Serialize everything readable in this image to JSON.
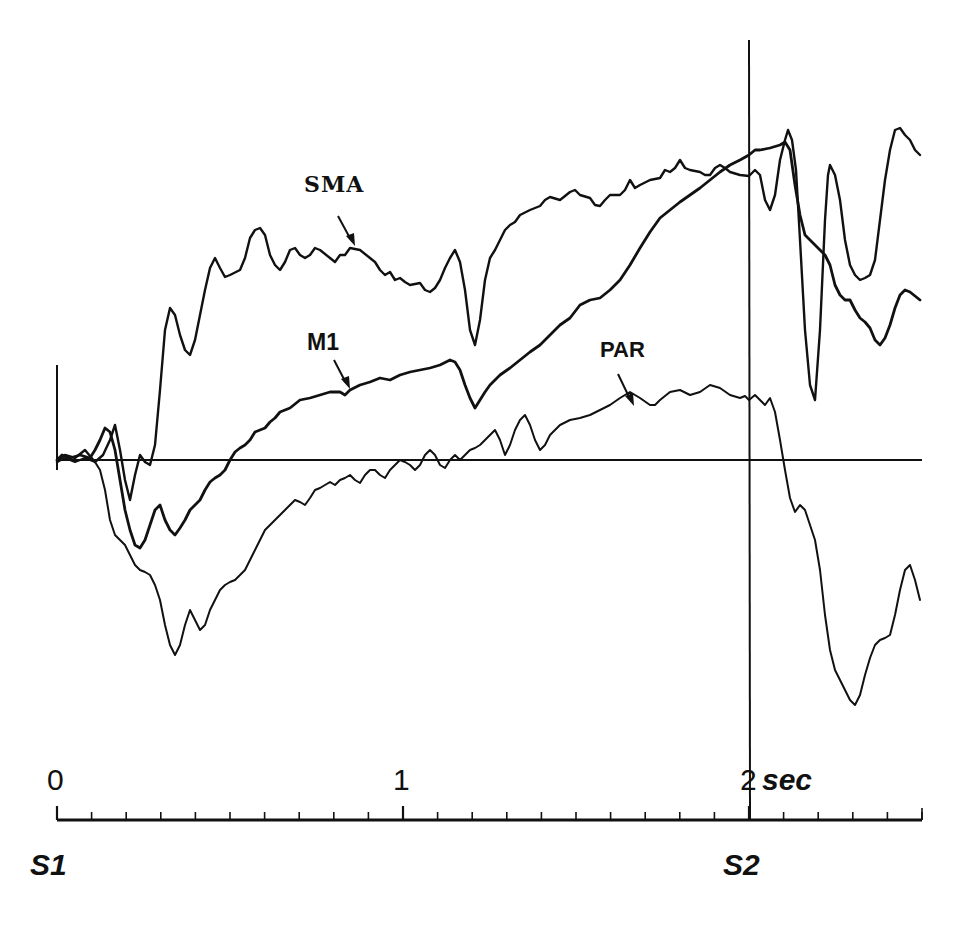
{
  "chart_data": {
    "type": "line",
    "title": "",
    "xlabel": "sec",
    "ylabel": "",
    "xlim": [
      0,
      2.5
    ],
    "grid": false,
    "legend": "inline labels with arrows",
    "x_axis": {
      "tick_labels": [
        "0",
        "1",
        "2 sec"
      ],
      "tick_values": [
        0,
        1,
        2
      ],
      "minor_tick_step": 0.1,
      "event_labels": [
        {
          "label": "S1",
          "t": 0
        },
        {
          "label": "S2",
          "t": 2
        }
      ]
    },
    "reference_lines": [
      {
        "type": "horizontal",
        "name": "baseline",
        "value": 0
      },
      {
        "type": "vertical",
        "name": "S2",
        "t": 2.0
      }
    ],
    "series_summary": [
      {
        "name": "SMA",
        "note": "early rise ~0.3 s to plateau, dip ~1.2 s, climbs to peak near S2, large oscillations after S2",
        "approx_values_rel": {
          "t": [
            0,
            0.3,
            0.5,
            1.0,
            1.2,
            1.5,
            2.0,
            2.1,
            2.2,
            2.3,
            2.45,
            2.5
          ],
          "y": [
            0,
            0.45,
            0.72,
            0.55,
            0.3,
            0.75,
            0.88,
            0.95,
            0.55,
            0.58,
            0.98,
            0.9
          ]
        }
      },
      {
        "name": "M1",
        "note": "initial dip below baseline, gradual ramp rising through S2, then drop and partial recovery",
        "approx_values_rel": {
          "t": [
            0,
            0.25,
            0.5,
            1.0,
            1.2,
            1.5,
            2.0,
            2.1,
            2.3,
            2.5
          ],
          "y": [
            0,
            -0.25,
            0.0,
            0.3,
            0.17,
            0.5,
            0.88,
            0.95,
            0.3,
            0.45
          ]
        }
      },
      {
        "name": "PAR",
        "note": "deep negative dip ~0.3 s, slow rise crossing baseline ~1.3 s, plateau before S2, falls sharply after S2",
        "approx_values_rel": {
          "t": [
            0,
            0.3,
            0.5,
            1.0,
            1.3,
            1.7,
            2.0,
            2.1,
            2.25,
            2.45,
            2.5
          ],
          "y": [
            0,
            -0.6,
            -0.35,
            -0.05,
            0.05,
            0.17,
            0.17,
            -0.1,
            -0.72,
            -0.3,
            -0.42
          ]
        }
      }
    ],
    "series": [
      {
        "name": "SMA",
        "label": "SMA",
        "stroke_width": 2.4,
        "points": "57,462 65,455 75,458 85,450 95,462 103,455 110,440 115,425 120,450 125,480 130,500 135,475 140,455 145,462 150,465 155,445 160,390 165,330 170,308 175,315 180,335 185,350 190,355 195,340 200,315 205,290 210,268 215,258 220,268 225,277 230,275 240,270 245,258 250,238 255,230 260,228 265,235 270,255 275,265 280,270 285,262 290,250 295,248 300,255 305,258 310,255 315,248 320,250 330,258 335,262 340,255 345,255 350,248 360,250 370,258 375,262 380,270 385,275 390,272 395,280 400,278 405,282 410,285 420,283 425,290 430,292 435,288 440,280 445,268 450,258 455,250 460,262 465,290 470,330 475,345 480,320 485,280 490,258 495,250 500,240 505,230 510,225 515,222 520,215 530,210 540,206 545,200 550,197 560,200 570,192 575,190 580,195 590,198 595,205 600,206 605,200 610,195 620,195 625,190 630,180 635,188 640,185 650,180 660,178 665,170 670,172 675,168 680,160 685,168 690,170 700,172 705,175 710,175 715,168 720,165 725,168 730,172 740,175 749,176 755,170 760,175 765,200 770,210 775,195 780,160 785,140 788,130 792,140 796,170 800,240 805,330 810,385 815,400 820,330 825,220 828,175 830,165 835,175 840,200 845,240 850,265 855,275 860,280 865,278 870,275 875,260 880,220 885,180 890,150 895,130 900,128 905,135 910,140 915,150 920,155"
      },
      {
        "name": "M1",
        "label": "M1",
        "stroke_width": 2.8,
        "points": "57,460 62,455 70,458 80,455 90,458 95,450 100,440 105,428 110,432 115,450 120,480 125,510 130,530 135,545 140,548 145,540 150,525 155,510 160,505 165,520 170,530 175,535 180,528 185,520 190,510 195,505 200,500 205,490 210,482 215,478 220,475 225,470 230,460 235,452 240,448 245,445 250,440 255,432 260,430 265,428 270,422 275,418 280,412 290,408 300,400 310,398 320,395 330,392 340,392 345,395 350,390 360,385 370,382 380,378 390,380 400,375 410,372 420,370 430,368 440,365 450,360 455,362 460,370 465,385 470,398 475,408 480,400 485,392 490,385 495,380 500,375 510,368 520,360 530,352 540,345 545,340 550,335 560,325 570,318 580,305 590,300 600,298 610,290 620,280 630,265 640,248 650,232 655,225 660,218 670,210 680,202 690,195 700,188 710,180 720,172 730,165 740,160 749,155 755,150 760,150 770,148 780,145 785,142 790,150 795,185 800,215 805,235 810,240 815,245 820,250 825,255 830,265 835,285 840,295 845,300 850,300 855,310 860,318 865,322 870,328 875,340 880,345 885,338 890,325 895,308 900,295 905,290 910,292 915,296 920,300"
      },
      {
        "name": "PAR",
        "label": "PAR",
        "stroke_width": 2.0,
        "points": "57,462 65,458 75,462 85,458 95,462 100,470 105,490 110,520 115,535 120,540 125,545 130,555 135,565 140,570 145,572 150,575 155,585 160,600 165,625 170,645 175,655 180,645 185,625 190,610 195,620 200,630 205,625 210,610 215,600 220,590 225,585 230,582 235,580 240,575 245,570 250,560 255,550 260,540 265,530 270,525 275,520 280,515 285,510 290,505 295,500 300,502 305,505 310,498 315,490 320,488 325,485 330,482 335,485 340,480 345,478 350,475 355,480 360,483 365,475 370,470 375,470 380,475 385,478 390,470 395,465 400,460 405,462 410,465 415,470 420,465 425,455 430,450 435,455 440,465 445,468 450,460 455,455 460,460 465,455 470,450 475,448 480,445 485,440 490,435 495,430 500,440 505,455 510,445 515,430 520,420 525,415 530,425 535,440 540,450 545,445 550,435 555,430 560,425 570,420 580,418 590,415 600,410 610,405 620,398 630,392 640,398 650,405 655,405 660,400 670,392 680,390 690,395 700,392 710,385 720,388 730,395 740,398 745,396 749,400 755,395 760,400 765,405 770,398 775,412 780,440 785,470 790,498 795,512 800,505 805,510 815,540 820,570 825,615 830,650 835,670 840,680 845,690 850,700 855,705 860,695 865,675 870,658 875,645 880,640 885,638 890,635 895,615 900,590 905,570 910,565 915,580 920,600"
      }
    ],
    "annotations": [
      {
        "text": "SMA",
        "x": 336,
        "y": 192,
        "arrow_from": [
          339,
          216
        ],
        "arrow_to": [
          353,
          245
        ]
      },
      {
        "text": "M1",
        "x": 319,
        "y": 349,
        "arrow_from": [
          334,
          359
        ],
        "arrow_to": [
          349,
          388
        ]
      },
      {
        "text": "PAR",
        "x": 619,
        "y": 358,
        "arrow_from": [
          619,
          374
        ],
        "arrow_to": [
          633,
          405
        ]
      }
    ]
  },
  "labels": {
    "sma": "SMA",
    "m1": "M1",
    "par": "PAR",
    "tick0": "0",
    "tick1": "1",
    "tick2": "2",
    "unit": "sec",
    "s1": "S1",
    "s2": "S2"
  }
}
